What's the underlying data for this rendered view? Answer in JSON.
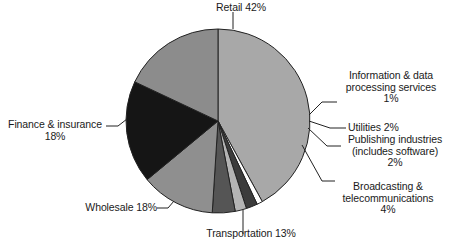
{
  "chart_data": {
    "type": "pie",
    "title": "",
    "subtitle": "",
    "xlabel": "",
    "ylabel": "",
    "legend_position": "none",
    "grid": false,
    "labels_outside": true,
    "units": "percent",
    "categories": [
      "Retail",
      "Information & data processing services",
      "Utilities",
      "Publishing industries (includes software)",
      "Broadcasting & telecommunications",
      "Transportation",
      "Wholesale",
      "Finance & insurance"
    ],
    "values": [
      42,
      1,
      2,
      2,
      4,
      13,
      18,
      18
    ],
    "slices": [
      {
        "name": "Retail",
        "value": 42,
        "value_text": "42%",
        "label_text": "Retail 42%",
        "color": "#a8a8a8",
        "start_angle_deg": 0,
        "end_angle_deg": 151.2
      },
      {
        "name": "Information & data processing services",
        "value": 1,
        "value_text": "1%",
        "label_text": "Information & data\nprocessing services\n1%",
        "color": "#ffffff",
        "start_angle_deg": 151.2,
        "end_angle_deg": 154.8
      },
      {
        "name": "Utilities",
        "value": 2,
        "value_text": "2%",
        "label_text": "Utilities 2%",
        "color": "#3c3c3c",
        "start_angle_deg": 154.8,
        "end_angle_deg": 162.0
      },
      {
        "name": "Publishing industries (includes software)",
        "value": 2,
        "value_text": "2%",
        "label_text": "Publishing industries\n(includes software)\n2%",
        "color": "#b4b4b4",
        "start_angle_deg": 162.0,
        "end_angle_deg": 169.2
      },
      {
        "name": "Broadcasting & telecommunications",
        "value": 4,
        "value_text": "4%",
        "label_text": "Broadcasting &\ntelecommunications\n4%",
        "color": "#555555",
        "start_angle_deg": 169.2,
        "end_angle_deg": 183.6
      },
      {
        "name": "Transportation",
        "value": 13,
        "value_text": "13%",
        "label_text": "Transportation 13%",
        "color": "#8f8f8f",
        "start_angle_deg": 183.6,
        "end_angle_deg": 230.4
      },
      {
        "name": "Wholesale",
        "value": 18,
        "value_text": "18%",
        "label_text": "Wholesale 18%",
        "color": "#151515",
        "start_angle_deg": 230.4,
        "end_angle_deg": 295.2
      },
      {
        "name": "Finance & insurance",
        "value": 18,
        "value_text": "18%",
        "label_text": "Finance & insurance\n18%",
        "color": "#8c8c8c",
        "start_angle_deg": 295.2,
        "end_angle_deg": 360.0
      }
    ],
    "total": 100,
    "outline_color": "#222222"
  },
  "labels": {
    "retail": "Retail 42%",
    "information": "Information & data\nprocessing services\n1%",
    "utilities": "Utilities 2%",
    "publishing": "Publishing industries\n(includes software)\n2%",
    "broadcasting": "Broadcasting &\ntelecommunications\n4%",
    "transportation": "Transportation 13%",
    "wholesale": "Wholesale 18%",
    "finance": "Finance & insurance\n18%"
  }
}
